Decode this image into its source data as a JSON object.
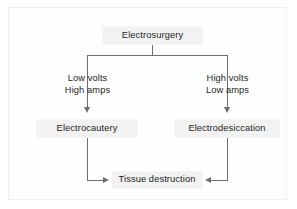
{
  "diagram": {
    "nodes": {
      "root": {
        "label": "Electrosurgery"
      },
      "left": {
        "label": "Electrocautery"
      },
      "right": {
        "label": "Electrodesiccation"
      },
      "outcome": {
        "label": "Tissue destruction"
      }
    },
    "edge_labels": {
      "left_line1": "Low volts",
      "left_line2": "High amps",
      "right_line1": "High volts",
      "right_line2": "Low amps"
    },
    "colors": {
      "node_fill": "#f2f2f2",
      "node_border": "#f7f7f7",
      "connector": "#6d6e70",
      "text": "#231f20",
      "frame_border": "#efefef",
      "background": "#ffffff"
    }
  }
}
